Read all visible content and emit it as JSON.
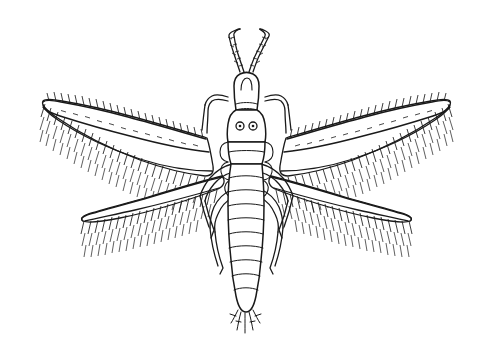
{
  "figure": {
    "subject_name": "thrips",
    "view": "dorsal",
    "style": "ink-line-drawing",
    "background_color": "#ffffff",
    "ink_color": "#1a1a1a",
    "width": 493,
    "height": 351,
    "caption": "",
    "label": ""
  },
  "anatomy": {
    "head": {
      "name": "head",
      "eye_count": 2,
      "eye_label": "compound-eye",
      "vertex_label": "vertex"
    },
    "antennae": {
      "name": "antennae",
      "count": 2,
      "segments_each": 8,
      "orientation": "upward-splayed"
    },
    "thorax": {
      "name": "thorax",
      "parts": [
        "prothorax",
        "pterothorax"
      ]
    },
    "abdomen": {
      "name": "abdomen",
      "segment_count": 10,
      "terminal_bristles": 7
    },
    "wings": {
      "name": "wings",
      "pairs": 2,
      "forewing_label": "forewing",
      "hindwing_label": "hindwing",
      "fringe_label": "marginal-fringe-setae",
      "total_wing_count": 4
    },
    "legs": {
      "name": "legs",
      "count": 6,
      "pairs": [
        "foreleg",
        "midleg",
        "hindleg"
      ]
    }
  },
  "measurements": {
    "body_length_px": 262,
    "wingspan_px": 447,
    "head_top_y": 28,
    "abdomen_tip_y": 330
  }
}
